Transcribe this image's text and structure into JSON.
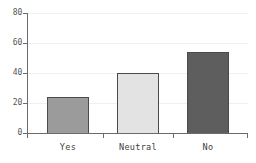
{
  "chart_data": {
    "type": "bar",
    "title": "",
    "subtitle": "",
    "xlabel": "",
    "ylabel": "",
    "categories": [
      "Yes",
      "Neutral",
      "No"
    ],
    "values": [
      25,
      41,
      54.5
    ],
    "series": [
      {
        "name": "Responses",
        "values": [
          25,
          41,
          54.5
        ]
      }
    ],
    "bar_colors": [
      "#9b9b9b",
      "#e3e3e3",
      "#5e5e5e"
    ],
    "bar_edge_color": "#4a4a4a",
    "ylim": [
      0,
      80
    ],
    "yticks": [
      0,
      20,
      40,
      60,
      80
    ],
    "ytick_labels": [
      "0",
      "20",
      "40",
      "60",
      "80"
    ],
    "xticks": [
      "Yes",
      "Neutral",
      "No"
    ],
    "grid": true,
    "grid_color": "#f0f0f0",
    "legend": false,
    "legend_position": "none",
    "axis_color": "#6b6b6b",
    "background_color": "#ffffff"
  }
}
